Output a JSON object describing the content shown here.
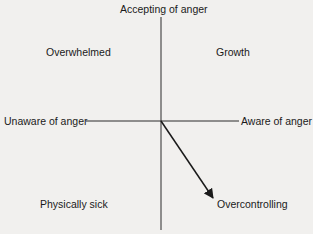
{
  "diagram": {
    "axes": {
      "vertical_top": "Accepting of anger",
      "horizontal_left": "Unaware of anger",
      "horizontal_right": "Aware of anger"
    },
    "quadrants": {
      "top_left": "Overwhelmed",
      "top_right": "Growth",
      "bottom_left": "Physically sick",
      "bottom_right": "Overcontrolling"
    },
    "arrow": {
      "from": "origin",
      "to": "Overcontrolling"
    }
  }
}
